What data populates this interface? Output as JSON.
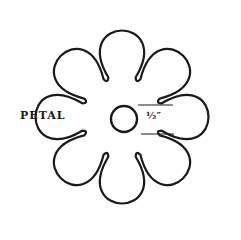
{
  "diagram": {
    "type": "flower-pattern",
    "petal_count": 8,
    "labels": {
      "petal": "PETAL",
      "center_size": "½″"
    },
    "stroke_color": "#1a1a1a",
    "background": "#ffffff"
  }
}
